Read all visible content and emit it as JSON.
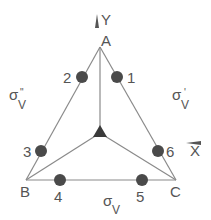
{
  "diagram": {
    "colors": {
      "line": "#8a8a8a",
      "circle": "#4a4a4a",
      "text": "#555555",
      "center_marker": "#3a3a3a",
      "background": "#ffffff"
    },
    "axes": {
      "y_label": "Y",
      "x_label": "X"
    },
    "vertices": [
      {
        "id": "A",
        "label": "A",
        "x": 100,
        "y": 47
      },
      {
        "id": "B",
        "label": "B",
        "x": 26,
        "y": 180
      },
      {
        "id": "C",
        "label": "C",
        "x": 176,
        "y": 180
      }
    ],
    "center": {
      "x": 100,
      "y": 133,
      "symbol": "C3 axis (triangle)"
    },
    "points": [
      {
        "label": "1",
        "x": 117,
        "y": 77
      },
      {
        "label": "2",
        "x": 82,
        "y": 77
      },
      {
        "label": "3",
        "x": 41,
        "y": 151
      },
      {
        "label": "4",
        "x": 60,
        "y": 180
      },
      {
        "label": "5",
        "x": 142,
        "y": 180
      },
      {
        "label": "6",
        "x": 158,
        "y": 151
      }
    ],
    "mirror_planes": [
      {
        "id": "sigma_v",
        "symbol": "σ",
        "sub": "V",
        "sup": ""
      },
      {
        "id": "sigma_v_prime",
        "symbol": "σ",
        "sub": "V",
        "sup": "'"
      },
      {
        "id": "sigma_v_double_prime",
        "symbol": "σ",
        "sub": "V",
        "sup": "\""
      }
    ]
  }
}
